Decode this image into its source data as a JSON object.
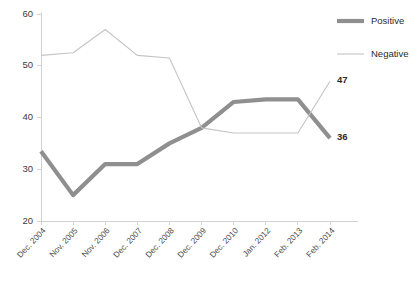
{
  "chart_data": {
    "type": "line",
    "title": "",
    "subtitle": "",
    "xlabel": "",
    "ylabel": "",
    "ylim": [
      20,
      60
    ],
    "yticks": [
      20,
      30,
      40,
      50,
      60
    ],
    "grid": false,
    "legend_position": "top-right",
    "categories": [
      "Dec. 2004",
      "Nov. 2005",
      "Nov. 2006",
      "Dec. 2007",
      "Dec. 2008",
      "Dec. 2009",
      "Dec. 2010",
      "Jan. 2012",
      "Feb. 2013",
      "Feb. 2014"
    ],
    "series": [
      {
        "name": "Positive",
        "color": "#8f8f8f",
        "line_width": 4.2,
        "values": [
          33.5,
          25,
          31,
          31,
          35,
          38,
          43,
          43.5,
          43.5,
          36
        ],
        "end_label": "36"
      },
      {
        "name": "Negative",
        "color": "#c4c4c4",
        "line_width": 1.1,
        "values": [
          52,
          52.5,
          57,
          52,
          51.5,
          38,
          37,
          37,
          37,
          47
        ],
        "end_label": "47"
      }
    ],
    "annotations": [
      {
        "text": "47",
        "series": "Negative",
        "category": "Feb. 2014"
      },
      {
        "text": "36",
        "series": "Positive",
        "category": "Feb. 2014"
      }
    ]
  },
  "legend": {
    "items": [
      {
        "label": "Positive",
        "color": "#8f8f8f",
        "thickness": "thick"
      },
      {
        "label": "Negative",
        "color": "#c4c4c4",
        "thickness": "thin"
      }
    ]
  },
  "axes": {
    "y_tick_labels": [
      "60",
      "50",
      "40",
      "30",
      "20"
    ],
    "x_tick_labels": [
      "Dec. 2004",
      "Nov. 2005",
      "Nov. 2006",
      "Dec. 2007",
      "Dec. 2008",
      "Dec. 2009",
      "Dec. 2010",
      "Jan. 2012",
      "Feb. 2013",
      "Feb. 2014"
    ]
  },
  "colors": {
    "positive": "#8f8f8f",
    "negative": "#c4c4c4",
    "axis": "#d2d2d2",
    "text": "#3b3b3b",
    "background": "#ffffff"
  }
}
